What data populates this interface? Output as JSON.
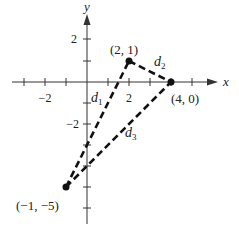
{
  "diagram": {
    "title": "",
    "axes": {
      "x_label": "x",
      "y_label": "y",
      "x_tick_labels": [
        {
          "value": -2,
          "label": "−2"
        },
        {
          "value": 2,
          "label": "2"
        }
      ],
      "y_tick_labels": [
        {
          "value": 2,
          "label": "2"
        },
        {
          "value": -2,
          "label": "−2"
        }
      ],
      "x_ticks": [
        -3,
        -2,
        -1,
        1,
        2,
        3,
        4,
        5
      ],
      "y_ticks": [
        2,
        1,
        -1,
        -2,
        -3,
        -4,
        -5,
        -6
      ]
    },
    "points": [
      {
        "id": "A",
        "x": 2,
        "y": 1,
        "label": "(2, 1)"
      },
      {
        "id": "B",
        "x": 4,
        "y": 0,
        "label": "(4, 0)"
      },
      {
        "id": "C",
        "x": -1,
        "y": -5,
        "label": "(−1, −5)"
      }
    ],
    "segments": [
      {
        "from": "C",
        "to": "A",
        "label": "d",
        "subscript": "1",
        "style": "dashed"
      },
      {
        "from": "A",
        "to": "B",
        "label": "d",
        "subscript": "2",
        "style": "dashed"
      },
      {
        "from": "C",
        "to": "B",
        "label": "d",
        "subscript": "3",
        "style": "dashed"
      }
    ]
  }
}
